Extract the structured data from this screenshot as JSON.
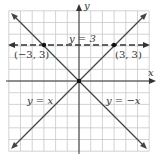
{
  "chart_data": {
    "type": "line",
    "title": "",
    "xlabel": "x",
    "ylabel": "y",
    "xlim": [
      -6,
      6
    ],
    "ylim": [
      -6,
      6
    ],
    "grid": true,
    "series": [
      {
        "name": "y = x",
        "label": "y = x",
        "style": "solid",
        "points": [
          [
            -6,
            -6
          ],
          [
            6,
            6
          ]
        ]
      },
      {
        "name": "y = -x",
        "label": "y = −x",
        "style": "solid",
        "points": [
          [
            -6,
            6
          ],
          [
            6,
            -6
          ]
        ]
      },
      {
        "name": "y = 3",
        "label": "y = 3",
        "style": "dashed",
        "points": [
          [
            -6,
            3
          ],
          [
            6,
            3
          ]
        ]
      }
    ],
    "marked_points": [
      {
        "x": -3,
        "y": 3,
        "label": "(−3, 3)"
      },
      {
        "x": 3,
        "y": 3,
        "label": "(3, 3)"
      },
      {
        "x": 0,
        "y": 0,
        "label": ""
      }
    ]
  },
  "labels": {
    "x_axis": "x",
    "y_axis": "y",
    "line_y3": "y = 3",
    "line_yx": "y = x",
    "line_ynegx": "y = −x",
    "point_left": "(−3, 3)",
    "point_right": "(3, 3)"
  },
  "colors": {
    "grid": "#c8c8c8",
    "axis": "#333333",
    "line": "#444444",
    "point": "#111111"
  }
}
